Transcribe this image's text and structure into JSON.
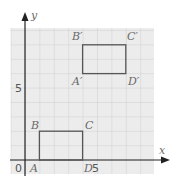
{
  "diagram": {
    "axes": {
      "x_label": "x",
      "y_label": "y",
      "origin_label": "0",
      "x_tick_label": "5",
      "y_tick_label": "5"
    },
    "grid": {
      "x_min": -1,
      "x_max": 9,
      "y_min": -1,
      "y_max": 9.2,
      "unit": 1
    },
    "colors": {
      "grid_fill": "#ececec",
      "grid_line": "#c8c8c8",
      "axis": "#222222",
      "shape": "#555555",
      "text": "#6a6a6a"
    },
    "rectangle_original": {
      "vertices": [
        {
          "name": "A",
          "x": 1,
          "y": 0
        },
        {
          "name": "B",
          "x": 1,
          "y": 2
        },
        {
          "name": "C",
          "x": 4,
          "y": 2
        },
        {
          "name": "D",
          "x": 4,
          "y": 0
        }
      ]
    },
    "rectangle_image": {
      "vertices": [
        {
          "name": "A′",
          "x": 4,
          "y": 6
        },
        {
          "name": "B′",
          "x": 4,
          "y": 8
        },
        {
          "name": "C′",
          "x": 7,
          "y": 8
        },
        {
          "name": "D′",
          "x": 7,
          "y": 6
        }
      ]
    },
    "labels": {
      "A": "A",
      "B": "B",
      "C": "C",
      "D": "D",
      "A_prime": "A′",
      "B_prime": "B′",
      "C_prime": "C′",
      "D_prime": "D′"
    }
  }
}
